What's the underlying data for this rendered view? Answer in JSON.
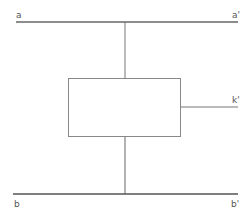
{
  "diagram": {
    "labels": {
      "a": "a",
      "a_prime": "a'",
      "k_prime": "k'",
      "b": "b",
      "b_prime": "b'"
    },
    "colors": {
      "line": "#666666",
      "background": "#ffffff"
    }
  }
}
